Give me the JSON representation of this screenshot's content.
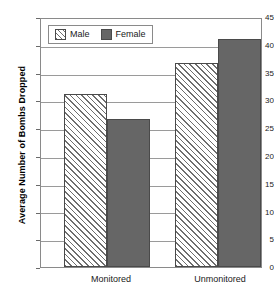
{
  "chart_data": {
    "type": "bar",
    "title": "",
    "xlabel": "",
    "ylabel": "Average Number of Bombs Dropped",
    "categories": [
      "Monitored",
      "Unmonitored"
    ],
    "series": [
      {
        "name": "Male",
        "values": [
          31.4,
          37.0
        ]
      },
      {
        "name": "Female",
        "values": [
          26.8,
          41.4
        ]
      }
    ],
    "ylim": [
      0,
      45
    ],
    "ytick_labels": [
      "0",
      "5",
      "10",
      "15",
      "20",
      "25",
      "30",
      "35",
      "40",
      "45"
    ],
    "ytick_values": [
      0,
      5,
      10,
      15,
      20,
      25,
      30,
      35,
      40,
      45
    ],
    "grid": "horizontal",
    "legend_position": "top-left",
    "colors": {
      "male_fill": "#ffffff",
      "male_hatch": "#6e6e6e",
      "female_fill": "#666666",
      "bar_outline": "#4a4a4a",
      "gridline": "#9a9a9a",
      "frame": "#8a8a8a",
      "text": "#1a1a1a",
      "background": "#ffffff"
    }
  },
  "legend": {
    "items": [
      {
        "label": "Male",
        "swatch": "hatched-swatch"
      },
      {
        "label": "Female",
        "swatch": "solid-gray-swatch"
      }
    ]
  },
  "axes": {
    "y_title": "Average Number of Bombs Dropped",
    "y_ticks": [
      "45",
      "40",
      "35",
      "30",
      "25",
      "20",
      "15",
      "10",
      "5",
      "0"
    ],
    "x_ticks": [
      "Monitored",
      "Unmonitored"
    ]
  }
}
